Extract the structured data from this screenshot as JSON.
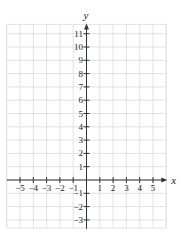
{
  "chart_data": {
    "type": "coordinate-plane",
    "title": "",
    "xlabel": "x",
    "ylabel": "y",
    "xlim": [
      -6,
      6
    ],
    "ylim": [
      -3.6,
      11.7
    ],
    "grid": true,
    "x_ticks": [
      -5,
      -4,
      -3,
      -2,
      -1,
      1,
      2,
      3,
      4,
      5
    ],
    "x_tick_labels": [
      "−5",
      "−4",
      "−3",
      "−2",
      "−1",
      "1",
      "2",
      "3",
      "4",
      "5"
    ],
    "y_ticks": [
      -3,
      -2,
      -1,
      1,
      2,
      3,
      4,
      5,
      6,
      7,
      8,
      9,
      10,
      11
    ],
    "y_tick_labels": [
      "−3",
      "−2",
      "−1",
      "1",
      "2",
      "3",
      "4",
      "5",
      "6",
      "7",
      "8",
      "9",
      "10",
      "11"
    ],
    "series": [],
    "colors": {
      "grid": "#e2e2e2",
      "axis": "#333333",
      "text": "#222222"
    }
  },
  "axes": {
    "x_label": "x",
    "y_label": "y"
  }
}
